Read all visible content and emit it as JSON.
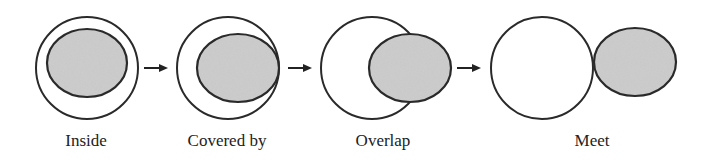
{
  "figure": {
    "colors": {
      "background": "#ffffff",
      "stroke": "#2a2a2a",
      "shaded_fill": "#c8c8c8",
      "text": "#222222"
    },
    "stages": [
      {
        "label": "Inside"
      },
      {
        "label": "Covered by"
      },
      {
        "label": "Overlap"
      },
      {
        "label": "Meet"
      }
    ],
    "arrows": [
      {
        "from": "Inside",
        "to": "Covered by",
        "icon": "right-arrow-icon"
      },
      {
        "from": "Covered by",
        "to": "Overlap",
        "icon": "right-arrow-icon"
      },
      {
        "from": "Overlap",
        "to": "Meet",
        "icon": "right-arrow-icon"
      }
    ]
  }
}
